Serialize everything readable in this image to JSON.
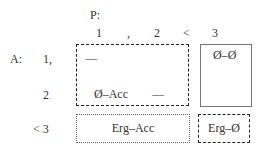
{
  "header": {
    "p_label": "P:",
    "p_values": [
      "1",
      ",",
      "2",
      "<",
      "3"
    ]
  },
  "rows": {
    "a_label": "A:",
    "a_values": [
      "1,",
      "2",
      "< 3"
    ]
  },
  "cells": {
    "dash_top": "—",
    "zero_acc": "Ø–Acc",
    "dash_mid": "—",
    "zero_zero": "Ø–Ø",
    "erg_acc": "Erg–Acc",
    "erg_zero": "Erg–Ø"
  }
}
